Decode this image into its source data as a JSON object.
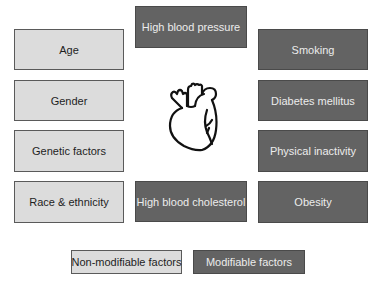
{
  "diagram": {
    "type": "cardiovascular-risk-factors",
    "center_icon": "anatomical-heart-icon",
    "non_modifiable": [
      {
        "label": "Age"
      },
      {
        "label": "Gender"
      },
      {
        "label": "Genetic factors"
      },
      {
        "label": "Race & ethnicity"
      }
    ],
    "modifiable_center": [
      {
        "label": "High blood pressure"
      },
      {
        "label": "High blood cholesterol"
      }
    ],
    "modifiable_right": [
      {
        "label": "Smoking"
      },
      {
        "label": "Diabetes mellitus"
      },
      {
        "label": "Physical inactivity"
      },
      {
        "label": "Obesity"
      }
    ],
    "legend": {
      "non_modifiable": "Non-modifiable factors",
      "modifiable": "Modifiable factors"
    },
    "colors": {
      "non_modifiable_fill": "#dcdcdc",
      "modifiable_fill": "#636363",
      "non_modifiable_text": "#1e1e1e",
      "modifiable_text": "#ececec"
    }
  }
}
